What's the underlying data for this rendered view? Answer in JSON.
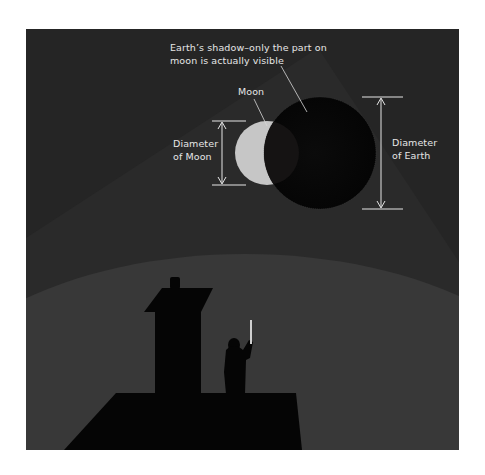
{
  "figure": {
    "labels": {
      "shadow_line1": "Earth’s shadow–only the part on",
      "shadow_line2": "moon is actually visible",
      "moon": "Moon",
      "diam_moon_line1": "Diameter",
      "diam_moon_line2": "of Moon",
      "diam_earth_line1": "Diameter",
      "diam_earth_line2": "of Earth"
    },
    "colors": {
      "page_background": "#ffffff",
      "sky": "#252525",
      "light_beam": "#2b2b2b",
      "ground": "#383838",
      "silhouette": "#050505",
      "moon": "#c6c6c6",
      "earth_shadow": "#060606",
      "annotation": "#e6e6e6"
    },
    "elements": {
      "moon": {
        "cx": 267,
        "cy": 153,
        "r": 32
      },
      "earth_shadow": {
        "cx": 320,
        "cy": 153,
        "r": 56
      },
      "moon_diameter_arrow": {
        "x": 222,
        "y1": 121,
        "y2": 185
      },
      "earth_diameter_arrow": {
        "x": 381,
        "y1": 97,
        "y2": 209
      }
    }
  }
}
